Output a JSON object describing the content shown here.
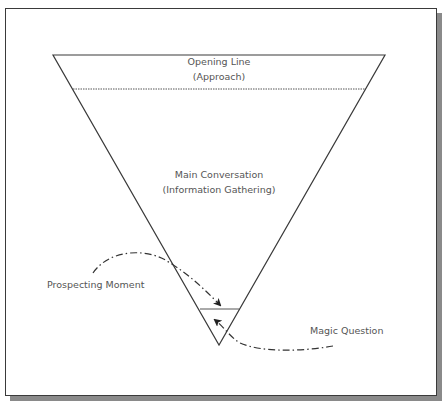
{
  "diagram": {
    "sections": {
      "top": {
        "line1": "Opening Line",
        "line2": "(Approach)"
      },
      "middle": {
        "line1": "Main Conversation",
        "line2": "(Information Gathering)"
      }
    },
    "annotations": {
      "left": "Prospecting Moment",
      "right": "Magic Question"
    },
    "colors": {
      "stroke": "#3a3a3a",
      "text": "#555555",
      "shadow": "#8a8a8a",
      "background": "#ffffff"
    }
  }
}
